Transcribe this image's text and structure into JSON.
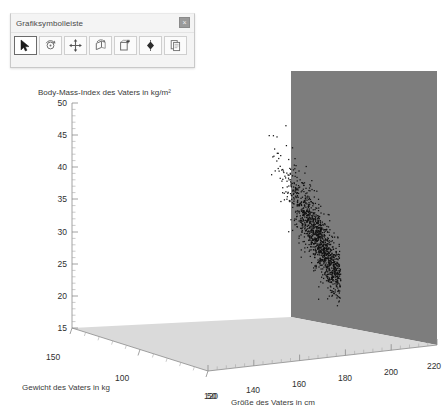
{
  "toolbar": {
    "title": "Grafiksymbolleiste",
    "close_label": "×",
    "buttons": [
      {
        "name": "select-pointer-tool",
        "icon": "pointer-icon",
        "selected": true
      },
      {
        "name": "rotate-tool",
        "icon": "rotate-icon",
        "selected": false
      },
      {
        "name": "move-tool",
        "icon": "move-arrows-icon",
        "selected": false
      },
      {
        "name": "spin-tool",
        "icon": "spin-icon",
        "selected": false
      },
      {
        "name": "add-frame-tool",
        "icon": "add-box-icon",
        "selected": false
      },
      {
        "name": "orbit-tool",
        "icon": "diamond-icon",
        "selected": false
      },
      {
        "name": "copy-tool",
        "icon": "copy-icon",
        "selected": false
      }
    ]
  },
  "chart_data": {
    "type": "scatter",
    "projection": "3d",
    "title": "",
    "xlabel": "Größe des Vaters in cm",
    "ylabel": "Body-Mass-Index des Vaters in kg/m²",
    "zlabel": "Gewicht des Vaters in kg",
    "xlim": [
      115,
      225
    ],
    "ylim": [
      15,
      50
    ],
    "zlim": [
      150,
      40
    ],
    "xticks": [
      120,
      140,
      160,
      180,
      200,
      220
    ],
    "yticks": [
      15,
      20,
      25,
      30,
      35,
      40,
      45,
      50
    ],
    "zticks": [
      150,
      100,
      50
    ],
    "grid": false,
    "legend": null,
    "marker": {
      "shape": "dot",
      "size": 1.2,
      "color": "#111111"
    },
    "panels": {
      "back_wall_color": "#7d7d7d",
      "floor_color": "#d9d9d9"
    },
    "n_points": 1400,
    "series": [
      {
        "name": "Väter",
        "note": "Dichte Punktwolke: BMI fällt mit zunehmender Körpergröße; Hauptmasse bei 160-180 cm und BMI 22-30.",
        "points_sample": [
          [
            149,
            47.5
          ],
          [
            151,
            45.2
          ],
          [
            152,
            44.0
          ],
          [
            150,
            42.6
          ],
          [
            153,
            43.1
          ],
          [
            154,
            41.2
          ],
          [
            155,
            40.4
          ],
          [
            156,
            39.6
          ],
          [
            157,
            38.8
          ],
          [
            155,
            38.0
          ],
          [
            158,
            37.5
          ],
          [
            159,
            36.8
          ],
          [
            157,
            36.2
          ],
          [
            160,
            35.9
          ],
          [
            161,
            35.1
          ],
          [
            159,
            34.6
          ],
          [
            162,
            34.2
          ],
          [
            163,
            33.6
          ],
          [
            161,
            33.0
          ],
          [
            164,
            32.8
          ],
          [
            165,
            32.1
          ],
          [
            163,
            31.6
          ],
          [
            166,
            31.4
          ],
          [
            167,
            30.8
          ],
          [
            165,
            30.3
          ],
          [
            168,
            30.0
          ],
          [
            169,
            29.4
          ],
          [
            167,
            29.0
          ],
          [
            170,
            28.7
          ],
          [
            171,
            28.2
          ],
          [
            169,
            27.8
          ],
          [
            172,
            27.5
          ],
          [
            173,
            27.0
          ],
          [
            171,
            26.6
          ],
          [
            174,
            26.4
          ],
          [
            175,
            25.9
          ],
          [
            173,
            25.5
          ],
          [
            176,
            25.2
          ],
          [
            177,
            24.8
          ],
          [
            175,
            24.4
          ],
          [
            178,
            24.2
          ],
          [
            179,
            23.8
          ],
          [
            177,
            23.4
          ],
          [
            180,
            23.1
          ],
          [
            181,
            22.7
          ],
          [
            179,
            22.4
          ],
          [
            182,
            22.2
          ],
          [
            183,
            21.8
          ],
          [
            181,
            21.5
          ],
          [
            184,
            21.2
          ],
          [
            185,
            20.9
          ],
          [
            183,
            20.6
          ],
          [
            186,
            20.4
          ],
          [
            187,
            20.0
          ],
          [
            185,
            19.7
          ],
          [
            188,
            19.5
          ],
          [
            189,
            19.1
          ],
          [
            187,
            18.8
          ],
          [
            190,
            18.5
          ],
          [
            191,
            18.2
          ]
        ]
      }
    ]
  }
}
